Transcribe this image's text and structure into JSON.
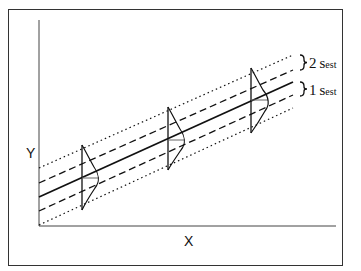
{
  "diagram": {
    "axes": {
      "x_label": "X",
      "y_label": "Y"
    },
    "band_labels": [
      {
        "multiplier": "2",
        "symbol": "s",
        "subscript": "est"
      },
      {
        "multiplier": "1",
        "symbol": "s",
        "subscript": "est"
      }
    ],
    "elements": [
      "regression line (solid)",
      "±1 s_est band (dashed)",
      "±2 s_est band (dotted)",
      "normal distribution curves at three X values"
    ],
    "colors": {
      "line": "#111111",
      "background": "#ffffff"
    }
  }
}
